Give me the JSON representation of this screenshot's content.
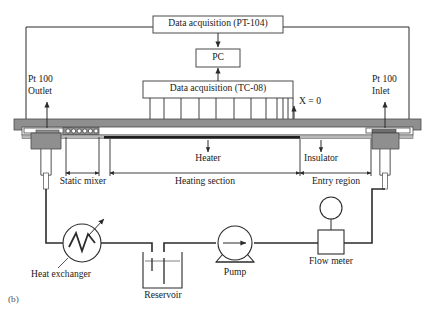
{
  "figure": {
    "caption": "(b)",
    "type": "process-flow-schematic"
  },
  "daq": {
    "pt104_label": "Data acquisition (PT-104)",
    "pc_label": "PC",
    "tc08_label": "Data acquisition (TC-08)",
    "thermocouple_count": 12
  },
  "sensors": {
    "outlet": {
      "line1": "Pt 100",
      "line2": "Outlet"
    },
    "inlet": {
      "line1": "Pt 100",
      "line2": "Inlet"
    },
    "origin_marker": "X = 0"
  },
  "test_section": {
    "heater_label": "Heater",
    "insulator_label": "Insulator",
    "dimensions": [
      {
        "name": "static-mixer",
        "label": "Static mixer"
      },
      {
        "name": "heating-section",
        "label": "Heating section"
      },
      {
        "name": "entry-region",
        "label": "Entry region"
      }
    ]
  },
  "loop": {
    "heat_exchanger_label": "Heat exchanger",
    "reservoir_label": "Reservoir",
    "pump_label": "Pump",
    "flow_meter_label": "Flow meter"
  },
  "colors": {
    "line": "#2b2b2b",
    "wall_fill": "#8f8f8f",
    "wall_stroke": "#4a4a4a",
    "pipe_fill": "#ffffff",
    "heater_strip": "#1f1f1f",
    "text": "#1a1a1a"
  }
}
